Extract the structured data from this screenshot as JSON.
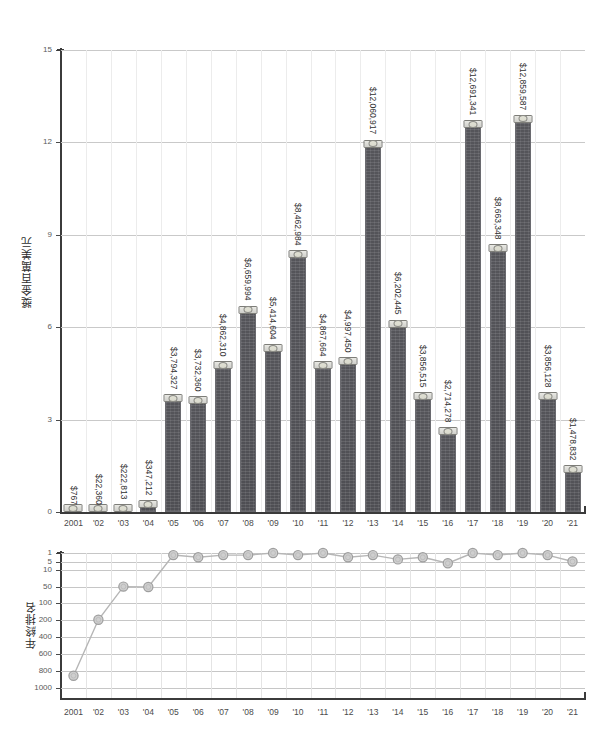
{
  "chart_data": [
    {
      "type": "bar",
      "title": "",
      "ylabel": "獎金百萬美元",
      "xlabel": "",
      "ylim": [
        0,
        15
      ],
      "yticks": [
        0,
        3,
        6,
        9,
        12,
        15
      ],
      "ytick_labels": [
        "0",
        "3",
        "6",
        "9",
        "12",
        "15"
      ],
      "unit_note": "millions of USD",
      "grid": true,
      "categories": [
        "2001",
        "'02",
        "'03",
        "'04",
        "'05",
        "'06",
        "'07",
        "'08",
        "'09",
        "'10",
        "'11",
        "'12",
        "'13",
        "'14",
        "'15",
        "'16",
        "'17",
        "'18",
        "'19",
        "'20",
        "'21"
      ],
      "values": [
        0.000767,
        0.02236,
        0.222813,
        0.347212,
        3.794327,
        3.73236,
        4.86231,
        6.659994,
        5.414604,
        8.462984,
        4.867664,
        4.99745,
        12.060917,
        6.202445,
        3.856515,
        2.714278,
        12.691341,
        8.663348,
        12.859587,
        3.856128,
        1.478832
      ],
      "data_labels": [
        "$767",
        "$22,360",
        "$222,813",
        "$347,212",
        "$3,794,327",
        "$3,732,360",
        "$4,862,310",
        "$6,659,994",
        "$5,414,604",
        "$8,462,984",
        "$4,867,664",
        "$4,997,450",
        "$12,060,917",
        "$6,202,445",
        "$3,856,515",
        "$2,714,278",
        "$12,691,341",
        "$8,663,348",
        "$12,859,587",
        "$3,856,128",
        "$1,478,832"
      ],
      "bar_color": "#52525 7",
      "marker_icon": "cash-stack-icon"
    },
    {
      "type": "line",
      "title": "",
      "ylabel": "年終排名",
      "xlabel": "",
      "y_scale": "inverted-rank",
      "yticks": [
        1,
        5,
        10,
        50,
        100,
        200,
        400,
        600,
        800,
        1000
      ],
      "ytick_labels": [
        "1",
        "5",
        "10",
        "50",
        "100",
        "200",
        "400",
        "600",
        "800",
        "1000"
      ],
      "grid": true,
      "categories": [
        "2001",
        "'02",
        "'03",
        "'04",
        "'05",
        "'06",
        "'07",
        "'08",
        "'09",
        "'10",
        "'11",
        "'12",
        "'13",
        "'14",
        "'15",
        "'16",
        "'17",
        "'18",
        "'19",
        "'20",
        "'21"
      ],
      "values": [
        855,
        199,
        49,
        50,
        2,
        3,
        2,
        2,
        1,
        2,
        1,
        2,
        3,
        4,
        2,
        3,
        5,
        7,
        1,
        2,
        1,
        2,
        5
      ],
      "ranks": [
        855,
        199,
        49,
        50,
        2,
        3,
        2,
        1,
        3,
        1,
        2,
        4,
        2,
        3,
        6,
        9,
        1,
        2,
        1,
        2,
        5
      ],
      "marker": "circle",
      "line_color": "#b6b6b6"
    }
  ],
  "bar_panel": {
    "ylabel": "獎金百萬美元",
    "yticks": [
      "15",
      "12",
      "9",
      "6",
      "3",
      "0"
    ],
    "xlabels": [
      "2001",
      "'02",
      "'03",
      "'04",
      "'05",
      "'06",
      "'07",
      "'08",
      "'09",
      "'10",
      "'11",
      "'12",
      "'13",
      "'14",
      "'15",
      "'16",
      "'17",
      "'18",
      "'19",
      "'20",
      "'21"
    ],
    "bars": [
      {
        "year": "2001",
        "label": "$767",
        "value": 0.000767
      },
      {
        "year": "'02",
        "label": "$22,360",
        "value": 0.02236
      },
      {
        "year": "'03",
        "label": "$222,813",
        "value": 0.222813
      },
      {
        "year": "'04",
        "label": "$347,212",
        "value": 0.347212
      },
      {
        "year": "'05",
        "label": "$3,794,327",
        "value": 3.794327
      },
      {
        "year": "'06",
        "label": "$3,732,360",
        "value": 3.73236
      },
      {
        "year": "'07",
        "label": "$4,862,310",
        "value": 4.86231
      },
      {
        "year": "'08",
        "label": "$6,659,994",
        "value": 6.659994
      },
      {
        "year": "'09",
        "label": "$5,414,604",
        "value": 5.414604
      },
      {
        "year": "'10",
        "label": "$8,462,984",
        "value": 8.462984
      },
      {
        "year": "'11",
        "label": "$4,867,664",
        "value": 4.867664
      },
      {
        "year": "'12",
        "label": "$4,997,450",
        "value": 4.99745
      },
      {
        "year": "'13",
        "label": "$12,060,917",
        "value": 12.060917
      },
      {
        "year": "'14",
        "label": "$6,202,445",
        "value": 6.202445
      },
      {
        "year": "'15",
        "label": "$3,856,515",
        "value": 3.856515
      },
      {
        "year": "'16",
        "label": "$2,714,278",
        "value": 2.714278
      },
      {
        "year": "'17",
        "label": "$12,691,341",
        "value": 12.691341
      },
      {
        "year": "'18",
        "label": "$8,663,348",
        "value": 8.663348
      },
      {
        "year": "'19",
        "label": "$12,859,587",
        "value": 12.859587
      },
      {
        "year": "'20",
        "label": "$3,856,128",
        "value": 3.856128
      },
      {
        "year": "'21",
        "label": "$1,478,832",
        "value": 1.478832
      }
    ]
  },
  "rank_panel": {
    "ylabel": "年終排名",
    "yticks": [
      "1",
      "5",
      "10",
      "50",
      "100",
      "200",
      "400",
      "600",
      "800",
      "1000"
    ],
    "xlabels": [
      "2001",
      "'02",
      "'03",
      "'04",
      "'05",
      "'06",
      "'07",
      "'08",
      "'09",
      "'10",
      "'11",
      "'12",
      "'13",
      "'14",
      "'15",
      "'16",
      "'17",
      "'18",
      "'19",
      "'20",
      "'21"
    ],
    "points": [
      {
        "year": "2001",
        "rank": 855
      },
      {
        "year": "'02",
        "rank": 199
      },
      {
        "year": "'03",
        "rank": 49
      },
      {
        "year": "'04",
        "rank": 50
      },
      {
        "year": "'05",
        "rank": 2
      },
      {
        "year": "'06",
        "rank": 3
      },
      {
        "year": "'07",
        "rank": 2
      },
      {
        "year": "'08",
        "rank": 2
      },
      {
        "year": "'09",
        "rank": 1
      },
      {
        "year": "'10",
        "rank": 2
      },
      {
        "year": "'11",
        "rank": 1
      },
      {
        "year": "'12",
        "rank": 3
      },
      {
        "year": "'13",
        "rank": 2
      },
      {
        "year": "'14",
        "rank": 4
      },
      {
        "year": "'15",
        "rank": 3
      },
      {
        "year": "'16",
        "rank": 6
      },
      {
        "year": "'17",
        "rank": 1
      },
      {
        "year": "'18",
        "rank": 2
      },
      {
        "year": "'19",
        "rank": 1
      },
      {
        "year": "'20",
        "rank": 2
      },
      {
        "year": "'21",
        "rank": 5
      }
    ]
  },
  "colors": {
    "bar": "#525257",
    "bar_edge": "#6a6a6f",
    "grid": "#c9c9c9",
    "axis": "#3b3b3b",
    "line": "#b6b6b6",
    "marker": "#cfcfcf",
    "text": "#2f2f2f",
    "background": "#ffffff"
  }
}
